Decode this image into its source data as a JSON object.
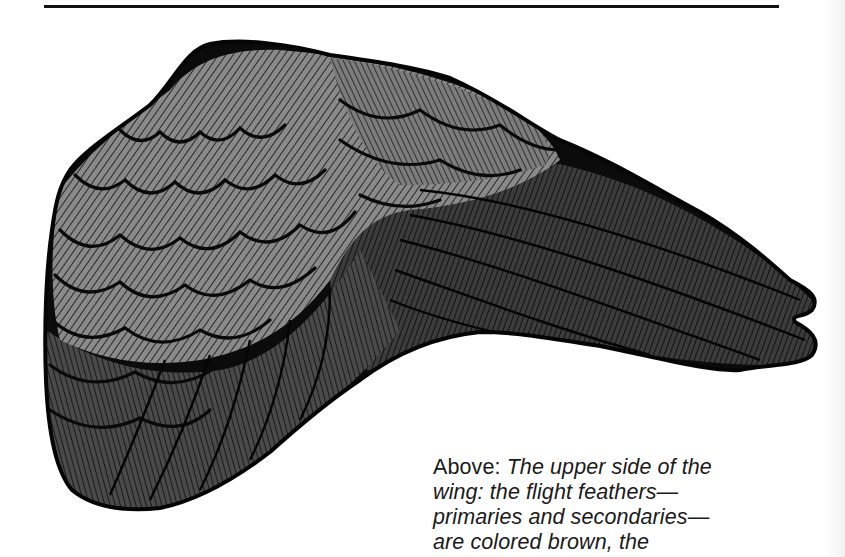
{
  "figure": {
    "colors": {
      "coverts_fill": "#8c8c8c",
      "coverts_dark_fill": "#6e6e6e",
      "flight_feathers_fill": "#3a3a3a",
      "outline": "#0a0a0a",
      "page": "#ffffff"
    }
  },
  "caption": {
    "lead": "Above:",
    "lines": [
      "The upper side of the",
      "wing: the flight feathers—",
      "primaries and secondaries—",
      "are colored brown, the"
    ]
  }
}
